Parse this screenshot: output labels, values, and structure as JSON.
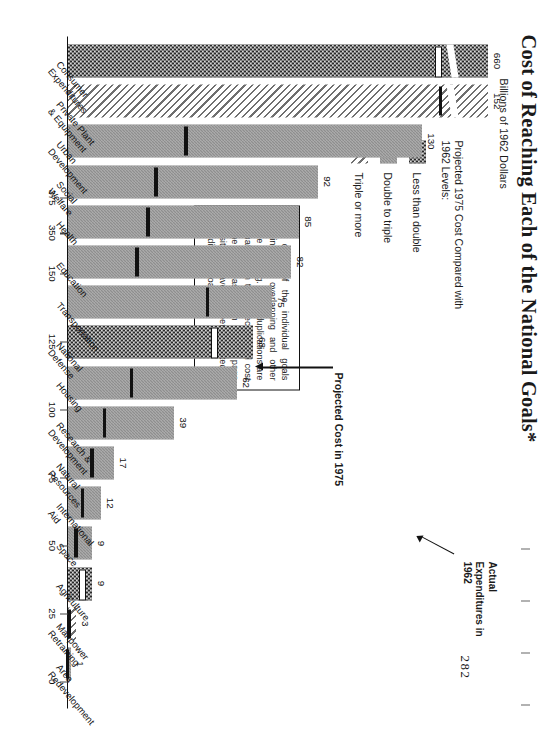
{
  "title": "Cost of Reaching Each of the National Goals*",
  "subtitle": "Billions of 1962 Dollars",
  "page_number": "282",
  "legend": {
    "title": "Projected 1975 Cost Compared with 1962 Levels:",
    "items": [
      {
        "label": "Less than double",
        "pattern": "dark"
      },
      {
        "label": "Double to triple",
        "pattern": "gray"
      },
      {
        "label": "Triple or more",
        "pattern": "hatch"
      }
    ]
  },
  "footnote": "*The costs of the individual goals contain some overlapping and other double counting. These duplications are eliminated from the projected total cost for the 16 areas shown on the page opposite but have not been allocated to the individual goals.",
  "annotations": {
    "actual": "Actual Expenditures in 1962",
    "projected": "Projected Cost in 1975"
  },
  "axis": {
    "ticks": [
      "0",
      "25",
      "50",
      "75",
      "100",
      "125",
      "150",
      "350",
      "375"
    ],
    "broken": true
  },
  "chart_data": {
    "type": "bar",
    "title": "Cost of Reaching Each of the National Goals*",
    "xlabel": "",
    "ylabel": "Billions of 1962 Dollars",
    "ylim": [
      0,
      150
    ],
    "grid": false,
    "legend_position": "top-left",
    "categories": [
      "Consumer Expenditures",
      "Private Plant & Equipment",
      "Urban Development",
      "Social Welfare",
      "Health",
      "Education",
      "Transportation",
      "National Defense",
      "Housing",
      "Research & Development",
      "Natural Resources",
      "International Aid",
      "Space",
      "Agriculture",
      "Manpower Retraining",
      "Area Redevelopment"
    ],
    "series": [
      {
        "name": "Projected 1975 Cost",
        "values": [
          660,
          152,
          130,
          92,
          85,
          82,
          75,
          68,
          62,
          39,
          17,
          12,
          9,
          9,
          3,
          1
        ]
      }
    ],
    "growth_class": [
      "dark",
      "hatch",
      "gray",
      "gray",
      "gray",
      "gray",
      "gray",
      "dark",
      "gray",
      "gray",
      "gray",
      "gray",
      "gray",
      "dark",
      "hatch",
      "gray"
    ],
    "actual_1962_marker": "black bar inside each column showing 1962 expenditure level"
  }
}
